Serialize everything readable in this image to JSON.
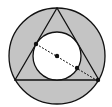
{
  "diagram": {
    "colors": {
      "shade": "#c4c4c4",
      "stroke": "#111111",
      "inner_fill": "#ffffff"
    },
    "outer_circle": {
      "cx": 57,
      "cy": 56,
      "r": 48
    },
    "triangle": {
      "points": "57,8 15,80 99,80"
    },
    "inner_circle": {
      "cx": 57,
      "cy": 56,
      "r": 24
    },
    "dashed_segment": {
      "x1": 36,
      "y1": 44,
      "x2": 98,
      "y2": 81
    },
    "points": [
      {
        "name": "tangent-point",
        "cx": 36,
        "cy": 44
      },
      {
        "name": "center-point",
        "cx": 57,
        "cy": 56
      },
      {
        "name": "circle-intersection-point",
        "cx": 77,
        "cy": 68
      },
      {
        "name": "vertex-point",
        "cx": 98,
        "cy": 80
      }
    ]
  }
}
